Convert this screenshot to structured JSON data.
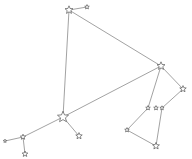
{
  "diagram": {
    "type": "constellation",
    "line_color": "#8a8a8a",
    "star_stroke": "#555555",
    "star_fill": "#ffffff",
    "stars": [
      {
        "id": "A",
        "x": 69,
        "y": 10,
        "r": 4.2
      },
      {
        "id": "B",
        "x": 87,
        "y": 7,
        "r": 2.4
      },
      {
        "id": "C",
        "x": 161,
        "y": 66,
        "r": 4.2
      },
      {
        "id": "D",
        "x": 183,
        "y": 89,
        "r": 3.4
      },
      {
        "id": "E",
        "x": 148,
        "y": 108,
        "r": 2.4
      },
      {
        "id": "F",
        "x": 156,
        "y": 108,
        "r": 2.4
      },
      {
        "id": "G",
        "x": 162,
        "y": 108,
        "r": 2.2
      },
      {
        "id": "H",
        "x": 127,
        "y": 130,
        "r": 2.4
      },
      {
        "id": "I",
        "x": 156,
        "y": 146,
        "r": 3.6
      },
      {
        "id": "J",
        "x": 63,
        "y": 117,
        "r": 5.8
      },
      {
        "id": "K",
        "x": 79,
        "y": 136,
        "r": 3.4
      },
      {
        "id": "L",
        "x": 23,
        "y": 137,
        "r": 2.8
      },
      {
        "id": "M",
        "x": 5,
        "y": 141,
        "r": 1.8
      },
      {
        "id": "N",
        "x": 25,
        "y": 154,
        "r": 3.0
      }
    ],
    "edges": [
      [
        "A",
        "B"
      ],
      [
        "A",
        "C"
      ],
      [
        "A",
        "J"
      ],
      [
        "C",
        "J"
      ],
      [
        "C",
        "E"
      ],
      [
        "C",
        "D"
      ],
      [
        "D",
        "G"
      ],
      [
        "G",
        "I"
      ],
      [
        "E",
        "H"
      ],
      [
        "H",
        "I"
      ],
      [
        "J",
        "K"
      ],
      [
        "J",
        "L"
      ],
      [
        "L",
        "M"
      ],
      [
        "L",
        "N"
      ]
    ]
  }
}
